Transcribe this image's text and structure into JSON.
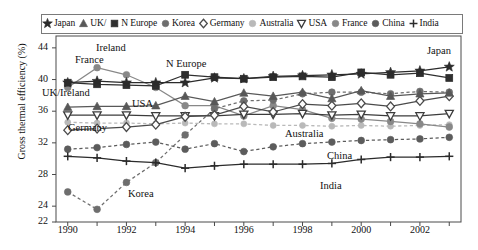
{
  "figure": {
    "axis": {
      "y_label": "Gross thermal efficiency (%)",
      "y_ticks": [
        "44",
        "40",
        "36",
        "32",
        "28",
        "24",
        "22"
      ],
      "x_ticks": [
        "1990",
        "1992",
        "1994",
        "1996",
        "1998",
        "2000",
        "2002"
      ]
    },
    "legend": [
      {
        "label": "Japan",
        "marker": "star-marker",
        "color": "#2b2b2b"
      },
      {
        "label": "UK/",
        "marker": "triangle-up-marker",
        "color": "#585858"
      },
      {
        "label": "N Europe",
        "marker": "square-marker",
        "color": "#2f2f2f"
      },
      {
        "label": "Korea",
        "marker": "circle-marker",
        "color": "#6e6e6e"
      },
      {
        "label": "Germany",
        "marker": "diamond-open-marker",
        "color": "#4a4a4a"
      },
      {
        "label": "Australia",
        "marker": "circle-light-marker",
        "color": "#b9b9b9"
      },
      {
        "label": "USA",
        "marker": "triangle-down-marker",
        "color": "#3c3c3c"
      },
      {
        "label": "France",
        "marker": "circle-gray-marker",
        "color": "#888888"
      },
      {
        "label": "China",
        "marker": "circle-dark-marker",
        "color": "#5c5c5c"
      },
      {
        "label": "India",
        "marker": "plus-marker",
        "color": "#2b2b2b"
      }
    ],
    "annotations": [
      {
        "text": "Ireland",
        "x": 96,
        "y": 42
      },
      {
        "text": "France",
        "x": 75,
        "y": 54
      },
      {
        "text": "UK/Ireland",
        "x": 42,
        "y": 87
      },
      {
        "text": "USA",
        "x": 132,
        "y": 98
      },
      {
        "text": "N Europe",
        "x": 166,
        "y": 58
      },
      {
        "text": "Germany",
        "x": 68,
        "y": 122
      },
      {
        "text": "Korea",
        "x": 128,
        "y": 188
      },
      {
        "text": "Australia",
        "x": 285,
        "y": 128
      },
      {
        "text": "China",
        "x": 327,
        "y": 150
      },
      {
        "text": "India",
        "x": 320,
        "y": 180
      },
      {
        "text": "Japan",
        "x": 427,
        "y": 45
      }
    ]
  },
  "chart_data": {
    "type": "line",
    "title": "",
    "xlabel": "",
    "ylabel": "Gross thermal efficiency (%)",
    "xlim": [
      1989.6,
      2003.4
    ],
    "ylim": [
      22,
      45.5
    ],
    "grid": false,
    "legend_position": "top-inside",
    "x": [
      1990,
      1991,
      1992,
      1993,
      1994,
      1995,
      1996,
      1997,
      1998,
      1999,
      2000,
      2001,
      2002,
      2003
    ],
    "series": [
      {
        "name": "Japan",
        "marker": "star",
        "linestyle": "solid",
        "color": "#2b2b2b",
        "values": [
          39.6,
          39.8,
          39.6,
          39.6,
          39.6,
          40.2,
          40.1,
          40.4,
          40.5,
          40.6,
          40.7,
          40.9,
          41.1,
          41.6
        ]
      },
      {
        "name": "UK/Ireland",
        "marker": "triangle-up",
        "linestyle": "solid",
        "color": "#585858",
        "values": [
          36.5,
          36.6,
          36.6,
          36.7,
          37.9,
          37.2,
          38.3,
          37.9,
          38.4,
          37.6,
          38.6,
          37.9,
          38.2,
          38.3
        ]
      },
      {
        "name": "N Europe",
        "marker": "square",
        "linestyle": "solid",
        "color": "#2f2f2f",
        "values": [
          39.6,
          39.4,
          39.3,
          39.2,
          40.6,
          40.3,
          40.1,
          40.3,
          40.4,
          40.3,
          40.9,
          40.6,
          40.8,
          40.2
        ]
      },
      {
        "name": "Korea",
        "marker": "circle",
        "linestyle": "dashed",
        "color": "#6e6e6e",
        "values": [
          25.8,
          23.6,
          27.0,
          29.5,
          33.0,
          36.3,
          37.3,
          37.4,
          38.2,
          38.4,
          38.4,
          38.2,
          38.5,
          38.4
        ]
      },
      {
        "name": "Germany",
        "marker": "diamond-open",
        "linestyle": "solid",
        "color": "#4a4a4a",
        "values": [
          33.6,
          33.8,
          34.0,
          34.3,
          35.3,
          35.5,
          36.6,
          35.9,
          36.9,
          36.7,
          37.0,
          36.6,
          37.3,
          37.9
        ]
      },
      {
        "name": "Australia",
        "marker": "circle-light",
        "linestyle": "dashed",
        "color": "#b9b9b9",
        "values": [
          34.6,
          34.5,
          34.5,
          34.4,
          34.5,
          34.4,
          34.4,
          34.2,
          34.2,
          34.1,
          34.2,
          34.1,
          34.2,
          34.3
        ]
      },
      {
        "name": "USA",
        "marker": "triangle-down",
        "linestyle": "solid",
        "color": "#3c3c3c",
        "values": [
          35.5,
          35.5,
          35.5,
          35.4,
          35.4,
          35.4,
          35.6,
          35.6,
          35.7,
          35.5,
          35.6,
          35.4,
          35.4,
          35.7
        ]
      },
      {
        "name": "France",
        "marker": "circle-gray",
        "linestyle": "solid",
        "color": "#888888",
        "values": [
          39.0,
          41.5,
          40.6,
          39.0,
          36.7,
          36.7,
          35.4,
          36.7,
          36.2,
          35.1,
          35.0,
          34.7,
          34.4,
          34.0
        ]
      },
      {
        "name": "China",
        "marker": "circle-dark",
        "linestyle": "dashed",
        "color": "#5c5c5c",
        "values": [
          31.2,
          31.4,
          31.8,
          32.1,
          31.2,
          31.9,
          30.9,
          31.5,
          31.9,
          32.1,
          32.3,
          32.4,
          32.5,
          32.7
        ]
      },
      {
        "name": "India",
        "marker": "plus",
        "linestyle": "solid",
        "color": "#2b2b2b",
        "values": [
          30.3,
          30.1,
          29.7,
          29.5,
          28.8,
          29.1,
          29.3,
          29.3,
          29.3,
          29.4,
          29.9,
          30.2,
          30.2,
          30.3
        ]
      }
    ]
  }
}
